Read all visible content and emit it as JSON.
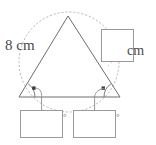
{
  "figure": {
    "colors": {
      "background": "#ffffff",
      "triangle_stroke": "#6e6e6e",
      "arc_stroke": "#b9b9b9",
      "box_stroke": "#9a9a9a",
      "leader_stroke": "#8c8c8c",
      "text": "#4a4a4a",
      "marker_fill": "#3a3a3a"
    },
    "labels": {
      "side_length": "8 cm",
      "unit": "cm"
    },
    "answer_boxes": [
      {
        "name": "side-length-answer-box",
        "value": "",
        "unit": "cm",
        "unit_position": "right-outside",
        "x": 101,
        "y": 29,
        "width": 33,
        "height": 33
      },
      {
        "name": "left-base-angle-answer-box",
        "value": "",
        "unit": "°",
        "unit_position": "right-edge",
        "x": 20,
        "y": 110,
        "width": 43,
        "height": 28
      },
      {
        "name": "right-base-angle-answer-box",
        "value": "",
        "unit": "°",
        "unit_position": "right-edge",
        "x": 73,
        "y": 110,
        "width": 43,
        "height": 28
      }
    ],
    "degree_symbols": {
      "left": "°",
      "right": "°"
    },
    "geometry": {
      "apex": {
        "x": 68,
        "y": 16
      },
      "base_left": {
        "x": 19,
        "y": 97
      },
      "base_right": {
        "x": 120,
        "y": 97
      },
      "arc": {
        "style": "dotted",
        "center": {
          "x": 69,
          "y": 62
        },
        "radius": 50
      },
      "angle_arcs": [
        {
          "vertex": "base_left",
          "radius": 16
        },
        {
          "vertex": "base_right",
          "radius": 16
        }
      ],
      "leader_lines": [
        {
          "from": "left-angle-marker",
          "to": "left-base-angle-answer-box"
        },
        {
          "from": "right-angle-marker",
          "to": "right-base-angle-answer-box"
        },
        {
          "from": "arc-upper-right",
          "to": "side-length-answer-box"
        }
      ]
    }
  }
}
